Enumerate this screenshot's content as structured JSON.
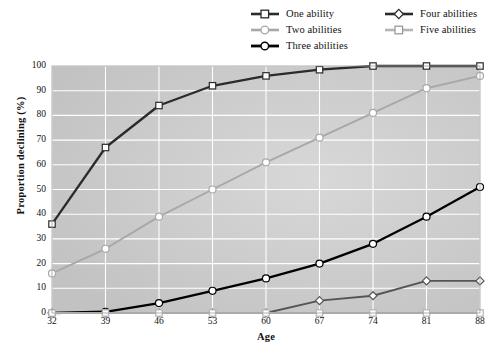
{
  "chart_data": {
    "type": "line",
    "title": "",
    "xlabel": "Age",
    "ylabel": "Proportion declining (%)",
    "categories": [
      32,
      39,
      46,
      53,
      60,
      67,
      74,
      81,
      88
    ],
    "xlim": [
      32,
      88
    ],
    "ylim": [
      0,
      100
    ],
    "ytick_labels": [
      "0",
      "10",
      "20",
      "30",
      "40",
      "50",
      "60",
      "70",
      "80",
      "90",
      "100"
    ],
    "xtick_labels": [
      "32",
      "39",
      "46",
      "53",
      "60",
      "67",
      "74",
      "81",
      "88"
    ],
    "grid": true,
    "legend_position": "top",
    "series": [
      {
        "name": "One ability",
        "values": [
          36,
          67,
          84,
          92,
          96,
          98.5,
          100,
          100,
          100
        ],
        "color": "#2b2b2b",
        "marker": "square",
        "marker_fill": "#ffffff"
      },
      {
        "name": "Two abilities",
        "values": [
          16,
          26,
          39,
          50,
          61,
          71,
          81,
          91,
          96
        ],
        "color": "#a8a8a8",
        "marker": "circle",
        "marker_fill": "#ffffff"
      },
      {
        "name": "Three abilities",
        "values": [
          0,
          0.5,
          4,
          9,
          14,
          20,
          28,
          39,
          51
        ],
        "color": "#000000",
        "marker": "circle",
        "marker_fill": "#ffffff"
      },
      {
        "name": "Four abilities",
        "values": [
          0,
          0,
          0,
          0,
          0,
          5,
          7,
          13,
          13
        ],
        "color": "#555555",
        "marker": "diamond",
        "marker_fill": "#ffffff"
      },
      {
        "name": "Five abilities",
        "values": [
          0,
          0,
          0,
          0,
          0,
          0,
          0,
          0,
          0
        ],
        "color": "#b5b5b5",
        "marker": "square",
        "marker_fill": "#ffffff"
      }
    ]
  },
  "legend": {
    "items": [
      {
        "label": "One ability"
      },
      {
        "label": "Two abilities"
      },
      {
        "label": "Three abilities"
      },
      {
        "label": "Four abilities"
      },
      {
        "label": "Five abilities"
      }
    ]
  },
  "style": {
    "plot_background": "#c9c9c9",
    "gridline_color": "#ffffff",
    "page_background": "#ffffff"
  }
}
